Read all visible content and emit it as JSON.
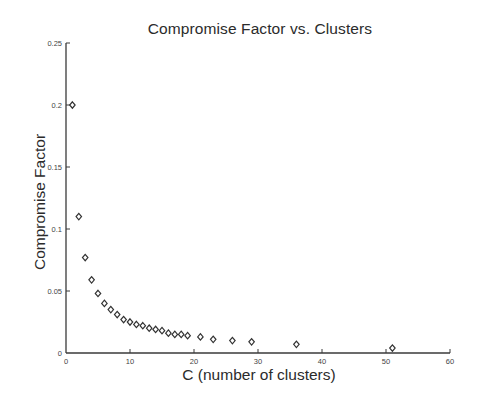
{
  "chart_data": {
    "type": "scatter",
    "title": "Compromise Factor vs. Clusters",
    "xlabel": "C (number of clusters)",
    "ylabel": "Compromise Factor",
    "xlim": [
      0,
      60
    ],
    "ylim": [
      0,
      0.25
    ],
    "xticks": [
      0,
      10,
      20,
      30,
      40,
      50,
      60
    ],
    "xtick_labels": [
      "0",
      "10",
      "20",
      "30",
      "40",
      "50",
      "60"
    ],
    "yticks": [
      0,
      0.05,
      0.1,
      0.15,
      0.2,
      0.25
    ],
    "ytick_labels": [
      "0",
      "0.05",
      "0.1",
      "0.15",
      "0.2",
      "0.25"
    ],
    "grid": false,
    "legend": null,
    "marker": "diamond",
    "marker_color": "#333333",
    "series": [
      {
        "name": "Compromise Factor",
        "x": [
          1,
          2,
          3,
          4,
          5,
          6,
          7,
          8,
          9,
          10,
          11,
          12,
          13,
          14,
          15,
          16,
          17,
          18,
          19,
          21,
          23,
          26,
          29,
          36,
          51
        ],
        "y": [
          0.2,
          0.11,
          0.077,
          0.059,
          0.048,
          0.04,
          0.035,
          0.031,
          0.027,
          0.025,
          0.023,
          0.022,
          0.02,
          0.019,
          0.018,
          0.016,
          0.015,
          0.015,
          0.014,
          0.013,
          0.011,
          0.01,
          0.009,
          0.007,
          0.004
        ]
      }
    ]
  }
}
